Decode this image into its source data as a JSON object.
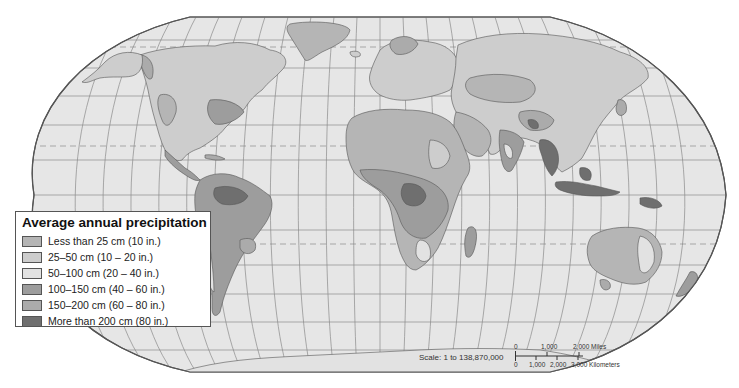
{
  "legend": {
    "title": "Average annual precipitation",
    "items": [
      {
        "label": "Less than 25 cm (10 in.)",
        "color": "#b5b5b5"
      },
      {
        "label": "25–50 cm (10 – 20 in.)",
        "color": "#cdcdcd"
      },
      {
        "label": "50–100 cm (20 – 40 in.)",
        "color": "#e2e2e2"
      },
      {
        "label": "100–150 cm (40 – 60 in.)",
        "color": "#9d9d9d"
      },
      {
        "label": "150–200 cm (60 – 80 in.)",
        "color": "#ababab"
      },
      {
        "label": "More than 200 cm (80 in.)",
        "color": "#6f6f6f"
      }
    ]
  },
  "scale": {
    "label": "Scale:  1 to 138,870,000",
    "miles_ticks": [
      "0",
      "1,000",
      "2,000 Miles"
    ],
    "km_ticks": [
      "0",
      "1,000",
      "2,000",
      "3,000 Kilometers"
    ]
  },
  "map": {
    "projection": "Robinson",
    "ocean_color": "#e6e6e6",
    "graticule_color": "#8a8a8a",
    "border_color": "#555555"
  }
}
